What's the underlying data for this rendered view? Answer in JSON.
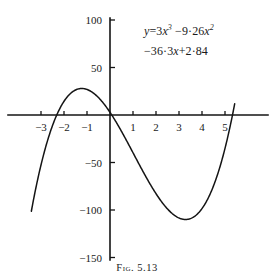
{
  "figure": {
    "caption_prefix": "Fig.",
    "caption_number": "5.13",
    "caption_full": "Fig. 5.13"
  },
  "equation": {
    "line1_lhs": "y",
    "line1_eq": "=",
    "line1_term1_coef": "3",
    "line1_term1_var": "x",
    "line1_term1_pow": "3",
    "line1_term2_sign": "−9·26",
    "line1_term2_var": "x",
    "line1_term2_pow": "2",
    "line2_term3": "−36·3",
    "line2_term3_var": "x",
    "line2_term4": "+2·84",
    "full_text": "y=3x³ −9·26x² −36·3x+2·84"
  },
  "chart_data": {
    "type": "line",
    "title": "",
    "subtitle": "",
    "xlabel": "",
    "ylabel": "",
    "annotation": "y=3x³−9·26x²−36·3x+2·84",
    "grid": false,
    "legend": "none",
    "polynomial": {
      "degree": 3,
      "coefficients_desc": [
        3,
        -9.26,
        -36.3,
        2.84
      ],
      "expression": "3*x^3 - 9.26*x^2 - 36.3*x + 2.84"
    },
    "xlim": [
      -3.45,
      5.45
    ],
    "ylim": [
      -152,
      112
    ],
    "x_ticks": [
      -3,
      -2,
      -1,
      1,
      2,
      3,
      4,
      5
    ],
    "x_tick_labels": [
      "−3",
      "−2",
      "−1",
      "1",
      "2",
      "3",
      "4",
      "5"
    ],
    "y_ticks": [
      100,
      50,
      -50,
      -100,
      -150
    ],
    "y_tick_labels": [
      "100",
      "50",
      "−50",
      "−100",
      "−150"
    ],
    "roots": [
      -2.12,
      0.078,
      5.13
    ],
    "local_maximum": {
      "x": -1.33,
      "y": 30.9
    },
    "local_minimum": {
      "x": 3.39,
      "y": -108.6
    },
    "y_intercept": 2.84,
    "x_domain_drawn": [
      -3.42,
      5.42
    ],
    "sample_points": [
      {
        "x": -3.4,
        "y": -150.4
      },
      {
        "x": -3.0,
        "y": -75.5
      },
      {
        "x": -2.5,
        "y": -14.7
      },
      {
        "x": -2.12,
        "y": 0.0
      },
      {
        "x": -1.5,
        "y": 24.5
      },
      {
        "x": -1.33,
        "y": 30.9
      },
      {
        "x": -1.0,
        "y": 26.8
      },
      {
        "x": -0.5,
        "y": 18.5
      },
      {
        "x": 0.0,
        "y": 2.84
      },
      {
        "x": 0.5,
        "y": -17.4
      },
      {
        "x": 1.0,
        "y": -39.7
      },
      {
        "x": 1.5,
        "y": -62.8
      },
      {
        "x": 2.0,
        "y": -84.5
      },
      {
        "x": 2.5,
        "y": -100.2
      },
      {
        "x": 3.0,
        "y": -108.5
      },
      {
        "x": 3.4,
        "y": -108.6
      },
      {
        "x": 4.0,
        "y": -93.6
      },
      {
        "x": 4.5,
        "y": -56.2
      },
      {
        "x": 5.0,
        "y": 12.3
      },
      {
        "x": 5.13,
        "y": 0.0
      },
      {
        "x": 5.42,
        "y": 112.0
      }
    ]
  },
  "axes": {
    "origin_px": {
      "x": 110,
      "y": 115
    },
    "x_unit_px": 23.0,
    "y_unit_px": 0.95,
    "x_axis_extent_px": {
      "x1": 8,
      "x2": 268
    },
    "y_axis_extent_px": {
      "y1": 18,
      "y2": 260
    }
  }
}
